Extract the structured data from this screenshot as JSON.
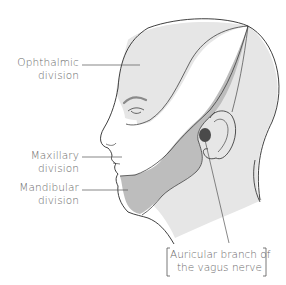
{
  "diagram": {
    "labels": {
      "ophthalmic": {
        "line1": "Ophthalmic",
        "line2": "division"
      },
      "maxillary": {
        "line1": "Maxillary",
        "line2": "division"
      },
      "mandibular": {
        "line1": "Mandibular",
        "line2": "division"
      },
      "auricular": {
        "line1": "Auricular branch of",
        "line2": "the vagus nerve"
      }
    },
    "colors": {
      "background": "#ffffff",
      "ophthalmic_region": "#e6e6e6",
      "maxillary_region": "#ffffff",
      "mandibular_region": "#bdbdbd",
      "scalp_neck_region": "#e6e6e6",
      "auricular_spot": "#4a4a4a",
      "outline": "#2a2a2a",
      "leader_lines": "#555555",
      "label_text": "#6a6a6a"
    }
  }
}
